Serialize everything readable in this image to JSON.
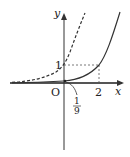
{
  "diagram": {
    "axes": {
      "x_label": "x",
      "y_label": "y",
      "origin_label": "O"
    },
    "ticks": {
      "y_one": "1",
      "x_two": "2"
    },
    "annotation": {
      "numerator": "1",
      "denominator": "9"
    },
    "curves": [
      {
        "name": "dashed exponential (passes through (0,1))",
        "style": "dashed"
      },
      {
        "name": "solid exponential (passes through (0,1/9) and (2,1))",
        "style": "solid"
      }
    ],
    "colors": {
      "axis": "#333333",
      "curve": "#333333",
      "guide": "#555555"
    }
  }
}
